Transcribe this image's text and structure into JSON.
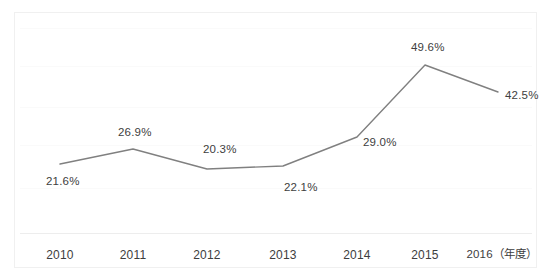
{
  "chart_data": {
    "type": "line",
    "title": "",
    "subtitle": "",
    "xlabel": "年度",
    "ylabel": "",
    "categories": [
      "2010",
      "2011",
      "2012",
      "2013",
      "2014",
      "2015",
      "2016"
    ],
    "tick_labels": [
      "2010",
      "2011",
      "2012",
      "2013",
      "2014",
      "2015",
      "2016（年度）"
    ],
    "values": [
      21.6,
      26.9,
      20.3,
      22.1,
      29.0,
      49.6,
      42.5
    ],
    "data_labels": [
      "21.6%",
      "26.9%",
      "20.3%",
      "22.1%",
      "29.0%",
      "49.6%",
      "42.5%"
    ],
    "series": [
      {
        "name": "",
        "values": [
          21.6,
          26.9,
          20.3,
          22.1,
          29.0,
          49.6,
          42.5
        ]
      }
    ],
    "ylim": [
      0,
      60
    ],
    "grid": true,
    "grid_horizontal": true,
    "grid_vertical": false,
    "legend": false,
    "legend_position": "none",
    "markers": false,
    "line_color": "#808080",
    "label_color": "#404040",
    "gridline_color": "#fafafa",
    "axis_color": "#ededed",
    "background_color": "#ffffff",
    "points": [
      {
        "label": "2010",
        "value": 21.6,
        "text": "21.6%",
        "x": 60,
        "y": 164,
        "label_x": 46,
        "label_y": 176
      },
      {
        "label": "2011",
        "value": 26.9,
        "text": "26.9%",
        "x": 133,
        "y": 149,
        "label_x": 118,
        "label_y": 127
      },
      {
        "label": "2012",
        "value": 20.3,
        "text": "20.3%",
        "x": 207,
        "y": 169,
        "label_x": 203,
        "label_y": 144
      },
      {
        "label": "2013",
        "value": 22.1,
        "text": "22.1%",
        "x": 283,
        "y": 166,
        "label_x": 284,
        "label_y": 182
      },
      {
        "label": "2014",
        "value": 29.0,
        "text": "29.0%",
        "x": 357,
        "y": 137,
        "label_x": 363,
        "label_y": 137
      },
      {
        "label": "2015",
        "value": 49.6,
        "text": "49.6%",
        "x": 425,
        "y": 65,
        "label_x": 411,
        "label_y": 42
      },
      {
        "label": "2016",
        "value": 42.5,
        "text": "42.5%",
        "x": 498,
        "y": 92,
        "label_x": 505,
        "label_y": 90
      }
    ],
    "gridlines_y": [
      28,
      66,
      107,
      145,
      188
    ],
    "tick_positions": [
      60,
      133,
      207,
      283,
      357,
      425,
      502
    ],
    "tick_y": 249
  }
}
